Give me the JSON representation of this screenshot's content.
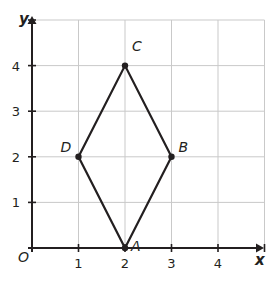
{
  "figure": {
    "origin_label": "O",
    "axes": {
      "x_name": "x",
      "y_name": "y",
      "x_ticks": [
        "1",
        "2",
        "3",
        "4"
      ],
      "y_ticks": [
        "1",
        "2",
        "3",
        "4"
      ],
      "x_range": [
        0,
        5
      ],
      "y_range": [
        0,
        5
      ],
      "grid": true,
      "grid_color": "#c9c9c9",
      "axis_color": "#231f20"
    },
    "shape": {
      "name": "rhombus-abcd",
      "stroke_color": "#231f20",
      "stroke_width": 2.2,
      "vertices": [
        {
          "label": "A",
          "x": 2,
          "y": 0,
          "label_dx": 6,
          "label_dy": -4
        },
        {
          "label": "B",
          "x": 3,
          "y": 2,
          "label_dx": 7,
          "label_dy": -12
        },
        {
          "label": "C",
          "x": 2,
          "y": 4,
          "label_dx": 7,
          "label_dy": -22
        },
        {
          "label": "D",
          "x": 1,
          "y": 2,
          "label_dx": -18,
          "label_dy": -12
        }
      ]
    }
  }
}
